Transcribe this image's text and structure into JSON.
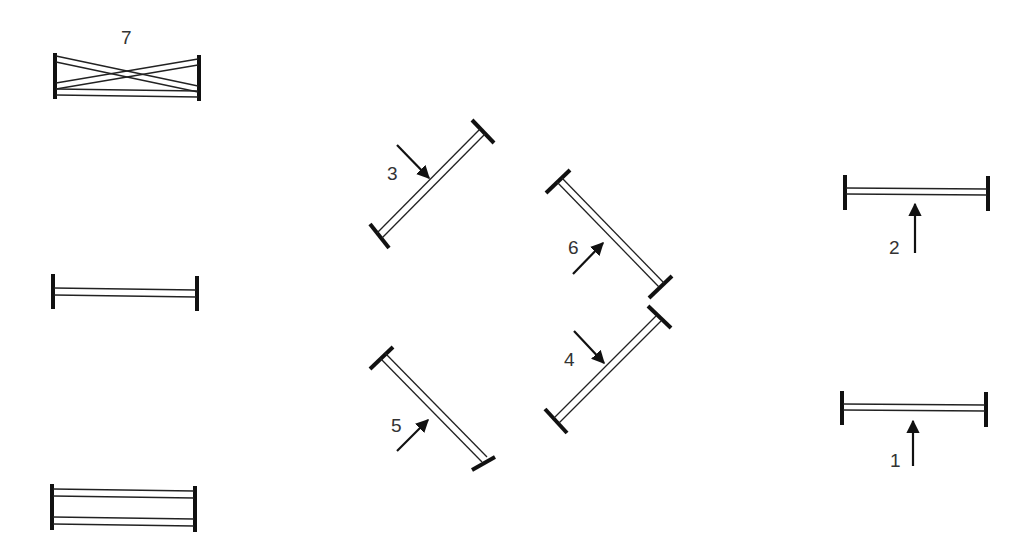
{
  "diagram": {
    "background": "#ffffff",
    "line_color": "#111111",
    "obstacles": [
      {
        "id": "fence-7",
        "number": "7",
        "type": "oxer-cross",
        "label_pos": [
          128,
          43
        ]
      },
      {
        "id": "fence-unnumbered-middle-left",
        "number": "",
        "type": "vertical"
      },
      {
        "id": "fence-unnumbered-bottom-left",
        "number": "",
        "type": "double-rail"
      },
      {
        "id": "fence-3",
        "number": "3",
        "type": "vertical",
        "direction": "down-right"
      },
      {
        "id": "fence-5",
        "number": "5",
        "type": "vertical",
        "direction": "up-right"
      },
      {
        "id": "fence-6",
        "number": "6",
        "type": "vertical",
        "direction": "up-right"
      },
      {
        "id": "fence-4",
        "number": "4",
        "type": "vertical",
        "direction": "down-right"
      },
      {
        "id": "fence-2",
        "number": "2",
        "type": "vertical",
        "direction": "up"
      },
      {
        "id": "fence-1",
        "number": "1",
        "type": "vertical",
        "direction": "up"
      }
    ],
    "labels": {
      "n1": "1",
      "n2": "2",
      "n3": "3",
      "n4": "4",
      "n5": "5",
      "n6": "6",
      "n7": "7"
    }
  }
}
